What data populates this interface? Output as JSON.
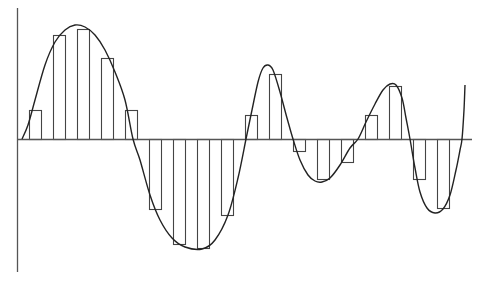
{
  "diagram": {
    "title": "",
    "colors": {
      "background": "#ffffff",
      "axis": "#555555",
      "bars": "#444444",
      "curve": "#222222",
      "sample_lines": "#555555"
    },
    "axes": {
      "y_axis": {
        "x": 17,
        "y_top": 8,
        "y_bottom": 272
      },
      "x_axis": {
        "y": 139,
        "x_start": 17,
        "x_end": 472
      }
    },
    "sample_spacing": 12,
    "sample_lines_x": [
      29,
      41,
      53,
      65,
      77,
      89,
      101,
      113,
      125,
      137,
      149,
      161,
      173,
      185,
      197,
      209,
      221,
      233,
      245,
      257,
      269,
      281,
      293,
      305,
      317,
      329,
      341,
      353,
      365,
      377,
      389,
      401,
      413,
      425,
      437,
      449
    ],
    "bars": [
      {
        "x": 29,
        "w": 12,
        "y": 110
      },
      {
        "x": 53,
        "w": 12,
        "y": 35
      },
      {
        "x": 77,
        "w": 12,
        "y": 29
      },
      {
        "x": 101,
        "w": 12,
        "y": 58
      },
      {
        "x": 125,
        "w": 12,
        "y": 110
      },
      {
        "x": 149,
        "w": 12,
        "y": 209
      },
      {
        "x": 173,
        "w": 12,
        "y": 244
      },
      {
        "x": 197,
        "w": 12,
        "y": 248
      },
      {
        "x": 221,
        "w": 12,
        "y": 215
      },
      {
        "x": 245,
        "w": 12,
        "y": 115
      },
      {
        "x": 269,
        "w": 12,
        "y": 74
      },
      {
        "x": 293,
        "w": 12,
        "y": 151
      },
      {
        "x": 317,
        "w": 12,
        "y": 179
      },
      {
        "x": 341,
        "w": 12,
        "y": 162
      },
      {
        "x": 365,
        "w": 12,
        "y": 115
      },
      {
        "x": 389,
        "w": 12,
        "y": 86
      },
      {
        "x": 413,
        "w": 12,
        "y": 179
      },
      {
        "x": 437,
        "w": 12,
        "y": 208
      }
    ],
    "curve_points": [
      [
        22,
        139
      ],
      [
        28,
        125
      ],
      [
        35,
        100
      ],
      [
        45,
        65
      ],
      [
        55,
        42
      ],
      [
        65,
        30
      ],
      [
        75,
        25
      ],
      [
        85,
        27
      ],
      [
        95,
        35
      ],
      [
        105,
        50
      ],
      [
        115,
        72
      ],
      [
        125,
        100
      ],
      [
        133,
        139
      ],
      [
        140,
        160
      ],
      [
        150,
        195
      ],
      [
        160,
        220
      ],
      [
        172,
        238
      ],
      [
        185,
        247
      ],
      [
        202,
        249
      ],
      [
        215,
        240
      ],
      [
        228,
        215
      ],
      [
        238,
        178
      ],
      [
        246,
        139
      ],
      [
        252,
        110
      ],
      [
        258,
        82
      ],
      [
        263,
        68
      ],
      [
        268,
        65
      ],
      [
        273,
        70
      ],
      [
        280,
        92
      ],
      [
        287,
        118
      ],
      [
        293,
        139
      ],
      [
        300,
        160
      ],
      [
        308,
        175
      ],
      [
        315,
        181
      ],
      [
        322,
        182
      ],
      [
        330,
        178
      ],
      [
        340,
        165
      ],
      [
        350,
        148
      ],
      [
        358,
        139
      ],
      [
        366,
        122
      ],
      [
        375,
        104
      ],
      [
        383,
        90
      ],
      [
        390,
        84
      ],
      [
        396,
        85
      ],
      [
        402,
        98
      ],
      [
        406,
        118
      ],
      [
        410,
        139
      ],
      [
        415,
        168
      ],
      [
        420,
        192
      ],
      [
        427,
        208
      ],
      [
        435,
        213
      ],
      [
        443,
        209
      ],
      [
        450,
        195
      ],
      [
        456,
        170
      ],
      [
        460,
        150
      ],
      [
        462,
        139
      ],
      [
        464,
        110
      ],
      [
        465,
        85
      ]
    ]
  }
}
